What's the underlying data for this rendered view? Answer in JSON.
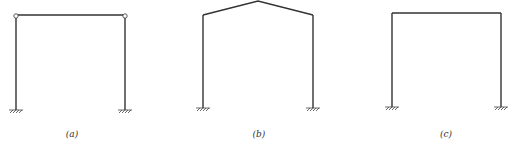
{
  "figure": {
    "frames": [
      {
        "id": "a",
        "label": "(a)",
        "type": "portal-frame-with-pinned-beam-joints"
      },
      {
        "id": "b",
        "label": "(b)",
        "type": "gable-frame"
      },
      {
        "id": "c",
        "label": "(c)",
        "type": "rigid-portal-frame"
      }
    ]
  }
}
